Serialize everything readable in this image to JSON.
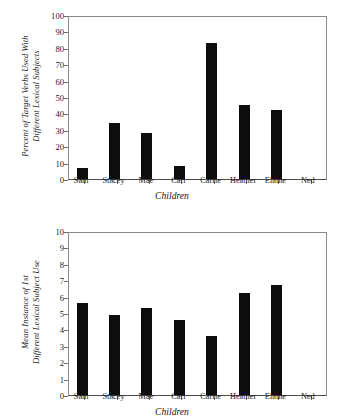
{
  "chart_data": [
    {
      "type": "bar",
      "title": "",
      "categories": [
        "Sam",
        "Stacey",
        "Mae",
        "Carl",
        "Carrie",
        "Heather",
        "Elaine",
        "Ned"
      ],
      "values": [
        7,
        34,
        28,
        8,
        83,
        45,
        42,
        0
      ],
      "xlabel": "Children",
      "ylabel": "Percent of Target Verbs Used With Different Lexical Subjects",
      "ylabel_line1": "Percent of Target Verbs Used With",
      "ylabel_line2": "Different Lexical Subjects",
      "yticks": [
        0,
        10,
        20,
        30,
        40,
        50,
        60,
        70,
        80,
        90,
        100
      ],
      "ylim": [
        0,
        100
      ],
      "grid": false,
      "legend": "none",
      "bar_color": "#0d0d0d"
    },
    {
      "type": "bar",
      "title": "",
      "categories": [
        "Sam",
        "Stacey",
        "Mae",
        "Carl",
        "Carrie",
        "Heather",
        "Elaine",
        "Ned"
      ],
      "values": [
        5.6,
        4.9,
        5.3,
        4.6,
        3.6,
        6.25,
        6.7,
        0
      ],
      "xlabel": "Children",
      "ylabel": "Mean Instance of 1st Different Lexical Subject Use",
      "ylabel_line1": "Mean Instance of 1st",
      "ylabel_line2": "Different Lexical Subject Use",
      "yticks": [
        0,
        1,
        2,
        3,
        4,
        5,
        6,
        7,
        8,
        9,
        10
      ],
      "ylim": [
        0,
        10
      ],
      "grid": false,
      "legend": "none",
      "bar_color": "#0d0d0d"
    }
  ]
}
